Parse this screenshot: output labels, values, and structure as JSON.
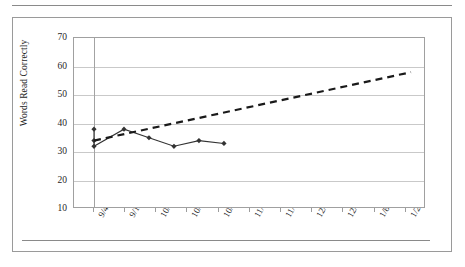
{
  "figure": {
    "name": "words-read-correctly-progress-monitoring-chart"
  },
  "chart_data": {
    "type": "line",
    "title": "",
    "xlabel": "",
    "ylabel": "Words Read Correctly",
    "ylim": [
      10,
      70
    ],
    "ytick_step": 10,
    "yticks": [
      "70",
      "60",
      "50",
      "40",
      "30",
      "20",
      "10"
    ],
    "ytick_values": [
      70,
      60,
      50,
      40,
      30,
      20,
      10
    ],
    "xticks": [
      "9/4",
      "9/18",
      "10/2",
      "10/16",
      "10/30",
      "11/13",
      "11/27",
      "12/11",
      "12/25",
      "1/8",
      "1/22"
    ],
    "grid": "horizontal",
    "legend": "none",
    "phase_line": {
      "label": "",
      "x_fraction": 0.0568,
      "style": "solid-vertical",
      "color": "#a3a3a3"
    },
    "series": [
      {
        "name": "Words Read Correctly (student data)",
        "style": "solid",
        "marker": "diamond",
        "color": "#333333",
        "points": [
          {
            "x_fraction": 0.0568,
            "date": "9/4",
            "value": 38
          },
          {
            "x_fraction": 0.0568,
            "date": "9/4",
            "value": 34
          },
          {
            "x_fraction": 0.0568,
            "date": "9/4",
            "value": 32
          },
          {
            "x_fraction": 0.142,
            "date": "9/18",
            "value": 38
          },
          {
            "x_fraction": 0.213,
            "date": "9/25",
            "value": 35
          },
          {
            "x_fraction": 0.284,
            "date": "10/2",
            "value": 32
          },
          {
            "x_fraction": 0.355,
            "date": "10/9",
            "value": 34
          },
          {
            "x_fraction": 0.426,
            "date": "10/16",
            "value": 33
          }
        ]
      },
      {
        "name": "Goal / aim line",
        "style": "dashed",
        "marker": "none",
        "color": "#1a1a1a",
        "points": [
          {
            "x_fraction": 0.0568,
            "date": "9/4",
            "value": 34
          },
          {
            "x_fraction": 0.9574,
            "date": "1/22",
            "value": 58
          }
        ]
      }
    ]
  },
  "y_axis": {
    "title": "Words Read Correctly",
    "ticks": [
      "70",
      "60",
      "50",
      "40",
      "30",
      "20",
      "10"
    ]
  },
  "x_axis": {
    "ticks": [
      "9/4",
      "9/18",
      "10/2",
      "10/16",
      "10/30",
      "11/13",
      "11/27",
      "12/11",
      "12/25",
      "1/8",
      "1/22"
    ]
  }
}
